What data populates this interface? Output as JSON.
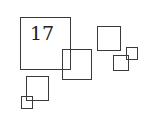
{
  "diagram": {
    "stroke_color": "#3a3a3a",
    "background": "#ffffff",
    "label": "17",
    "squares": [
      {
        "id": "big",
        "x": 20,
        "y": 17,
        "w": 51,
        "h": 53
      },
      {
        "id": "middle",
        "x": 62,
        "y": 49,
        "w": 30,
        "h": 31
      },
      {
        "id": "top-right",
        "x": 97,
        "y": 26,
        "w": 24,
        "h": 25
      },
      {
        "id": "right-small",
        "x": 113,
        "y": 55,
        "w": 16,
        "h": 16
      },
      {
        "id": "right-smaller",
        "x": 126,
        "y": 47,
        "w": 12,
        "h": 13
      },
      {
        "id": "bottom-left",
        "x": 26,
        "y": 76,
        "w": 23,
        "h": 25
      },
      {
        "id": "bottom-left-tiny",
        "x": 21,
        "y": 96,
        "w": 12,
        "h": 13
      }
    ]
  }
}
